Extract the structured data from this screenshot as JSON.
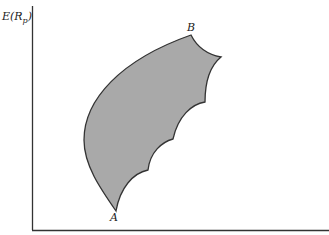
{
  "figure": {
    "type": "opportunity-set-diagram",
    "y_axis_label": {
      "main": "E(R",
      "sub": "p",
      "close": ")"
    },
    "x_axis_label": "",
    "points": [
      {
        "label": "A",
        "role": "minimum-return-end"
      },
      {
        "label": "B",
        "role": "maximum-return-end"
      }
    ],
    "colors": {
      "fill": "#a9a9a9",
      "stroke": "#333333",
      "axis": "#333333",
      "background": "#ffffff"
    }
  }
}
